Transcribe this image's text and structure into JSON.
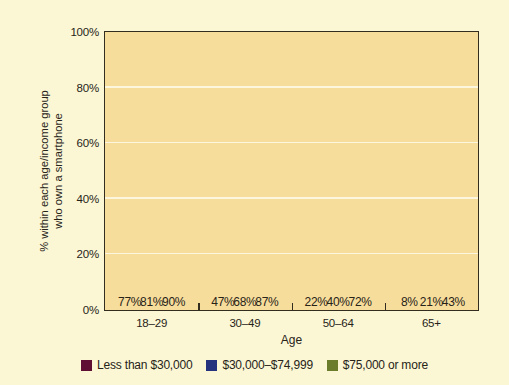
{
  "chart_data": {
    "type": "bar",
    "title": "",
    "xlabel": "Age",
    "ylabel": "% within each age/income group\nwho own a smartphone",
    "ylabel_line1": "% within each age/income group",
    "ylabel_line2": "who own a smartphone",
    "categories": [
      "18–29",
      "30–49",
      "50–64",
      "65+"
    ],
    "series": [
      {
        "name": "Less than $30,000",
        "color": "#5e0f33",
        "values": [
          77,
          47,
          22,
          8
        ],
        "labels": [
          "77%",
          "47%",
          "22%",
          "8%"
        ]
      },
      {
        "name": "$30,000–$74,999",
        "color": "#25327d",
        "values": [
          81,
          68,
          40,
          21
        ],
        "labels": [
          "81%",
          "68%",
          "40%",
          "21%"
        ]
      },
      {
        "name": "$75,000 or more",
        "color": "#6b7d2b",
        "values": [
          90,
          87,
          72,
          43
        ],
        "labels": [
          "90%",
          "87%",
          "72%",
          "43%"
        ]
      }
    ],
    "ylim": [
      0,
      100
    ],
    "yticks": [
      0,
      20,
      40,
      60,
      80,
      100
    ],
    "ytick_labels": [
      "0%",
      "20%",
      "40%",
      "60%",
      "80%",
      "100%"
    ],
    "grid": true,
    "gridline_color": "#fdf6de",
    "legend_position": "bottom",
    "plot_background": "#f7dd9b",
    "figure_background": "#fbf7d4",
    "axis_color": "#332d20"
  }
}
